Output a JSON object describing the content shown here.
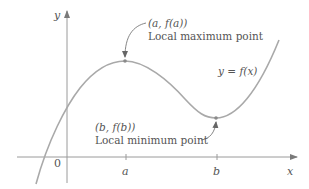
{
  "figure": {
    "type": "function-graph",
    "axes": {
      "x_label": "x",
      "y_label": "y",
      "origin_label": "0",
      "x_ticks": [
        {
          "label": "a",
          "x": 126
        },
        {
          "label": "b",
          "x": 217
        }
      ]
    },
    "curve": {
      "label": "y = f(x)",
      "color": "#a9a9a9"
    },
    "annotations": [
      {
        "id": "local-max",
        "coord_label": "(a, f(a))",
        "description": "Local maximum point"
      },
      {
        "id": "local-min",
        "coord_label": "(b, f(b))",
        "description": "Local minimum point"
      }
    ],
    "colors": {
      "axis": "#9a9a9a",
      "curve": "#a9a9a9",
      "text": "#555555",
      "arrow": "#666666"
    }
  }
}
